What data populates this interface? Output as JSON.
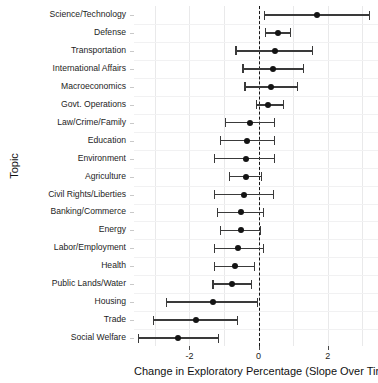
{
  "chart_data": {
    "type": "scatter",
    "subtype": "dot-and-whisker coefficient plot",
    "title": "",
    "xlabel": "Change in Exploratory Percentage (Slope Over Time)",
    "ylabel": "Topic",
    "xlim": [
      -3.6,
      3.45
    ],
    "xticks": [
      -2,
      0,
      2
    ],
    "xticklabels": [
      "-2",
      "0",
      "2"
    ],
    "grid": "vertical and horizontal light gridlines",
    "reference_line": {
      "value": 0,
      "style": "dashed",
      "color": "#151515"
    },
    "legend": "none",
    "point_color": "#141414",
    "errorbar_color": "#3a3a3a",
    "categories": [
      "Science/Technology",
      "Defense",
      "Transportation",
      "International Affairs",
      "Macroeconomics",
      "Govt. Operations",
      "Law/Crime/Family",
      "Education",
      "Environment",
      "Agriculture",
      "Civil Rights/Liberties",
      "Banking/Commerce",
      "Energy",
      "Labor/Employment",
      "Health",
      "Public Lands/Water",
      "Housing",
      "Trade",
      "Social Welfare"
    ],
    "values": [
      1.69,
      0.56,
      0.48,
      0.42,
      0.37,
      0.28,
      -0.25,
      -0.34,
      -0.37,
      -0.37,
      -0.42,
      -0.51,
      -0.51,
      -0.59,
      -0.68,
      -0.76,
      -1.32,
      -1.8,
      -2.34
    ],
    "ci_low": [
      0.17,
      0.2,
      -0.65,
      -0.45,
      -0.39,
      -0.06,
      -0.96,
      -1.1,
      -1.27,
      -0.85,
      -1.27,
      -1.18,
      -1.1,
      -1.27,
      -1.27,
      -1.32,
      -2.65,
      -3.04,
      -3.46
    ],
    "ci_high": [
      3.21,
      0.93,
      1.55,
      1.3,
      1.13,
      0.73,
      0.45,
      0.45,
      0.45,
      0.08,
      0.42,
      0.14,
      0.06,
      0.14,
      -0.11,
      -0.2,
      -0.03,
      -0.62,
      -1.15
    ]
  }
}
